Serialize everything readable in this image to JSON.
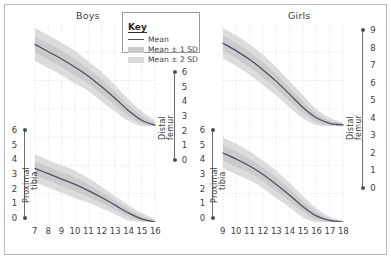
{
  "figure": {
    "background": "#ffffff",
    "frame_color": "#b9b9b9"
  },
  "key": {
    "title": "Key",
    "items": [
      {
        "label": "Mean",
        "style": "line",
        "color": "#4a4f63"
      },
      {
        "label": "Mean ± 1 SD",
        "style": "band",
        "color": "#c9c9c9"
      },
      {
        "label": "Mean ± 2 SD",
        "style": "band",
        "color": "#d9d9d9"
      }
    ]
  },
  "panels": [
    {
      "id": "boys",
      "title": "Boys",
      "x_ticks": [
        "7",
        "8",
        "9",
        "10",
        "11",
        "12",
        "13",
        "14",
        "15",
        "16"
      ],
      "left_axis": {
        "label_line1": "Proximal",
        "label_line2": "tibia",
        "ticks": [
          "6",
          "5",
          "4",
          "3",
          "2",
          "1",
          "0"
        ]
      },
      "right_axis": {
        "label_line1": "Distal",
        "label_line2": "femur",
        "ticks": [
          "6",
          "5",
          "4",
          "3",
          "2",
          "1",
          "0"
        ]
      }
    },
    {
      "id": "girls",
      "title": "Girls",
      "x_ticks": [
        "9",
        "10",
        "11",
        "12",
        "13",
        "14",
        "15",
        "16",
        "17",
        "18"
      ],
      "left_axis": {
        "label_line1": "Proximal",
        "label_line2": "tibia",
        "ticks": [
          "6",
          "5",
          "4",
          "3",
          "2",
          "1",
          "0"
        ]
      },
      "right_axis": {
        "label_line1": "Distal",
        "label_line2": "femur",
        "ticks": [
          "9",
          "8",
          "7",
          "6",
          "5",
          "4",
          "3",
          "2",
          "1",
          "0"
        ]
      }
    }
  ],
  "chart_data": {
    "type": "line",
    "title": "",
    "subtitle": "",
    "xlabel": "",
    "ylabel": "",
    "grid": true,
    "legend_position": "top-center",
    "legend": [
      "Mean",
      "Mean ± 1 SD",
      "Mean ± 2 SD"
    ],
    "panels": [
      {
        "name": "Boys",
        "x": [
          7,
          8,
          9,
          10,
          11,
          12,
          13,
          14,
          15,
          16
        ],
        "xlim": [
          7,
          16
        ],
        "subplots": [
          {
            "name": "Distal femur",
            "ylabel": "Distal femur",
            "ylim": [
              0,
              6
            ],
            "series": [
              {
                "name": "Mean",
                "values": [
                  5.0,
                  4.55,
                  4.1,
                  3.6,
                  3.05,
                  2.4,
                  1.7,
                  0.95,
                  0.35,
                  0.05
                ]
              },
              {
                "name": "Mean + 1 SD",
                "values": [
                  5.5,
                  5.05,
                  4.6,
                  4.1,
                  3.5,
                  2.85,
                  2.1,
                  1.3,
                  0.6,
                  0.2
                ]
              },
              {
                "name": "Mean - 1 SD",
                "values": [
                  4.5,
                  4.05,
                  3.6,
                  3.1,
                  2.6,
                  1.95,
                  1.3,
                  0.6,
                  0.15,
                  0.0
                ]
              },
              {
                "name": "Mean + 2 SD",
                "values": [
                  6.0,
                  5.55,
                  5.1,
                  4.6,
                  3.95,
                  3.3,
                  2.5,
                  1.65,
                  0.9,
                  0.35
                ]
              },
              {
                "name": "Mean - 2 SD",
                "values": [
                  4.0,
                  3.55,
                  3.1,
                  2.6,
                  2.15,
                  1.5,
                  0.9,
                  0.3,
                  0.0,
                  0.0
                ]
              }
            ]
          },
          {
            "name": "Proximal tibia",
            "ylabel": "Proximal tibia",
            "ylim": [
              0,
              6
            ],
            "series": [
              {
                "name": "Mean",
                "values": [
                  3.5,
                  3.15,
                  2.8,
                  2.45,
                  2.05,
                  1.6,
                  1.1,
                  0.6,
                  0.2,
                  0.0
                ]
              },
              {
                "name": "Mean + 1 SD",
                "values": [
                  3.95,
                  3.6,
                  3.25,
                  2.9,
                  2.45,
                  1.95,
                  1.4,
                  0.85,
                  0.4,
                  0.1
                ]
              },
              {
                "name": "Mean - 1 SD",
                "values": [
                  3.05,
                  2.7,
                  2.35,
                  2.0,
                  1.65,
                  1.25,
                  0.8,
                  0.35,
                  0.05,
                  0.0
                ]
              },
              {
                "name": "Mean + 2 SD",
                "values": [
                  4.4,
                  4.05,
                  3.7,
                  3.35,
                  2.85,
                  2.3,
                  1.7,
                  1.1,
                  0.6,
                  0.2
                ]
              },
              {
                "name": "Mean - 2 SD",
                "values": [
                  2.6,
                  2.25,
                  1.9,
                  1.55,
                  1.25,
                  0.9,
                  0.5,
                  0.1,
                  0.0,
                  0.0
                ]
              }
            ]
          }
        ]
      },
      {
        "name": "Girls",
        "x": [
          9,
          10,
          11,
          12,
          13,
          14,
          15,
          16,
          17,
          18
        ],
        "xlim": [
          9,
          18
        ],
        "subplots": [
          {
            "name": "Distal femur",
            "ylabel": "Distal femur",
            "ylim": [
              0,
              9
            ],
            "series": [
              {
                "name": "Mean",
                "values": [
                  7.6,
                  6.9,
                  6.1,
                  5.15,
                  4.1,
                  2.9,
                  1.7,
                  0.75,
                  0.25,
                  0.1
                ]
              },
              {
                "name": "Mean + 1 SD",
                "values": [
                  8.3,
                  7.6,
                  6.8,
                  5.85,
                  4.75,
                  3.5,
                  2.25,
                  1.15,
                  0.5,
                  0.2
                ]
              },
              {
                "name": "Mean - 1 SD",
                "values": [
                  6.9,
                  6.2,
                  5.4,
                  4.45,
                  3.45,
                  2.3,
                  1.2,
                  0.4,
                  0.05,
                  0.0
                ]
              },
              {
                "name": "Mean + 2 SD",
                "values": [
                  9.0,
                  8.3,
                  7.5,
                  6.55,
                  5.4,
                  4.1,
                  2.8,
                  1.55,
                  0.75,
                  0.3
                ]
              },
              {
                "name": "Mean - 2 SD",
                "values": [
                  6.2,
                  5.5,
                  4.7,
                  3.75,
                  2.8,
                  1.7,
                  0.7,
                  0.1,
                  0.0,
                  0.0
                ]
              }
            ]
          },
          {
            "name": "Proximal tibia",
            "ylabel": "Proximal tibia",
            "ylim": [
              0,
              6
            ],
            "series": [
              {
                "name": "Mean",
                "values": [
                  4.5,
                  4.1,
                  3.65,
                  3.1,
                  2.45,
                  1.75,
                  1.0,
                  0.4,
                  0.1,
                  0.0
                ]
              },
              {
                "name": "Mean + 1 SD",
                "values": [
                  5.0,
                  4.6,
                  4.1,
                  3.55,
                  2.9,
                  2.15,
                  1.35,
                  0.65,
                  0.2,
                  0.05
                ]
              },
              {
                "name": "Mean - 1 SD",
                "values": [
                  4.0,
                  3.6,
                  3.2,
                  2.65,
                  2.0,
                  1.35,
                  0.65,
                  0.15,
                  0.0,
                  0.0
                ]
              },
              {
                "name": "Mean + 2 SD",
                "values": [
                  5.5,
                  5.1,
                  4.6,
                  4.0,
                  3.35,
                  2.55,
                  1.7,
                  0.9,
                  0.35,
                  0.1
                ]
              },
              {
                "name": "Mean - 2 SD",
                "values": [
                  3.5,
                  3.1,
                  2.7,
                  2.2,
                  1.55,
                  0.95,
                  0.3,
                  0.0,
                  0.0,
                  0.0
                ]
              }
            ]
          }
        ]
      }
    ]
  }
}
